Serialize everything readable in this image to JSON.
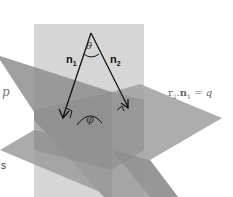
{
  "figure": {
    "type": "two intersecting planes with normals",
    "header_faint_text": "",
    "labels": {
      "n1": {
        "base": "n",
        "sub": "1"
      },
      "n2": {
        "base": "n",
        "sub": "2"
      },
      "theta": "θ",
      "phi": "φ",
      "left_plane": "p",
      "right_plane_equation": {
        "r": "r",
        "r_sub": "2",
        "dot": ".",
        "n": "n",
        "n_sub": "1",
        "rhs": "= q"
      },
      "bottom_left_fragment": "s"
    },
    "colors": {
      "vertical_plane": "#d4d4d4",
      "left_plane": "#9a9a9a",
      "right_plane": "#a8a8a8",
      "overlap": "#8c8c8c",
      "arrows": "#111111",
      "background": "#ffffff"
    }
  }
}
